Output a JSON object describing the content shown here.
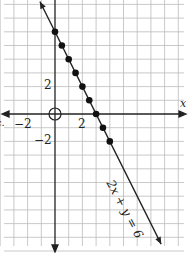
{
  "chart_data": {
    "type": "line",
    "title": "",
    "equation_label": "2x + y = 6",
    "xlabel": "x",
    "ylabel": "",
    "x_tick_labels": [
      "−2",
      "2"
    ],
    "y_tick_labels": [
      "2",
      "−2"
    ],
    "xlim": [
      -4,
      9
    ],
    "ylim": [
      -10,
      8
    ],
    "grid": true,
    "origin_marker": "open-circle",
    "points": [
      {
        "x": 0,
        "y": 6
      },
      {
        "x": 0.5,
        "y": 5
      },
      {
        "x": 1,
        "y": 4
      },
      {
        "x": 1.5,
        "y": 3
      },
      {
        "x": 2,
        "y": 2
      },
      {
        "x": 2.5,
        "y": 1
      },
      {
        "x": 3,
        "y": 0
      },
      {
        "x": 3.5,
        "y": -1
      },
      {
        "x": 4,
        "y": -2
      }
    ],
    "line": {
      "slope": -2,
      "intercept": 6
    }
  },
  "labels": {
    "x_axis": "x",
    "x_neg2": "−2",
    "x_pos2": "2",
    "y_pos2": "2",
    "y_neg2": "−2",
    "equation": "2x + y = 6",
    "left_edge": "c."
  }
}
